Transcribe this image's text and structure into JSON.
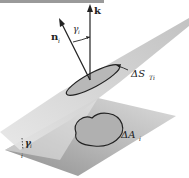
{
  "figure": {
    "labels": {
      "k_vector": "k",
      "n_vector": "n",
      "n_subscript": "i",
      "gamma_top": "γ",
      "gamma_top_sub": "i",
      "delta_s": "ΔS",
      "delta_s_sub": "Ti",
      "delta_a": "ΔA",
      "delta_a_sub": "i",
      "gamma_bottom": "γ",
      "gamma_bottom_sub": "i",
      "bottom_mark": "i"
    },
    "colors": {
      "upper_plane": "#c8c8c8",
      "lower_plane_light": "#d9d9d9",
      "lower_plane_dark": "#a9a9a9",
      "line": "#222222",
      "top_bar": "#9a9a9a"
    }
  }
}
